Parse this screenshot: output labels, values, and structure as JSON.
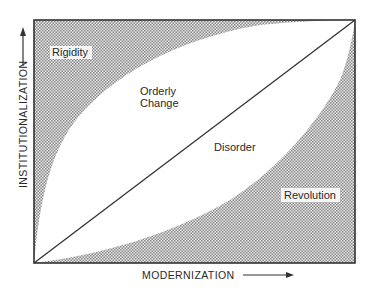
{
  "diagram": {
    "type": "conceptual-region-plot",
    "axes": {
      "x_label": "MODERNIZATION",
      "y_label": "INSTITUTIONALIZATION"
    },
    "regions": {
      "rigidity": "Rigidity",
      "orderly_change_line1": "Orderly",
      "orderly_change_line2": "Change",
      "disorder": "Disorder",
      "revolution": "Revolution"
    },
    "colors": {
      "line": "#333333",
      "shade": "#b8b8b8",
      "frame": "#333333"
    }
  }
}
